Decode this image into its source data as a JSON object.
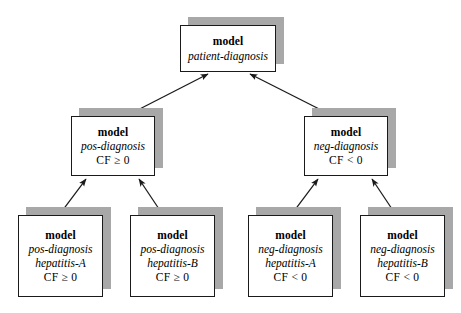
{
  "diagram": {
    "type": "model-hierarchy-tree",
    "title_text": "",
    "edge_direction": "child-to-parent",
    "colors": {
      "box_fill": "#ffffff",
      "box_border": "#1a1a1a",
      "shadow": "#a8a8a8",
      "edge": "#1a1a1a",
      "text": "#000000"
    },
    "nodes": [
      {
        "id": "root",
        "label_model": "model",
        "label_name": "patient-diagnosis",
        "label_cf": "",
        "x": 180,
        "y": 25,
        "w": 96,
        "h": 47
      },
      {
        "id": "pos-diagnosis",
        "label_model": "model",
        "label_name": "pos-diagnosis",
        "label_cf": "CF ≥ 0",
        "x": 71,
        "y": 116,
        "w": 84,
        "h": 60
      },
      {
        "id": "neg-diagnosis",
        "label_model": "model",
        "label_name": "neg-diagnosis",
        "label_cf": "CF < 0",
        "x": 304,
        "y": 116,
        "w": 84,
        "h": 60
      },
      {
        "id": "pos-hep-a",
        "label_model": "model",
        "label_name": "pos-diagnosis",
        "label_name2": "hepatitis-A",
        "label_cf": "CF ≥ 0",
        "x": 18,
        "y": 215,
        "w": 85,
        "h": 82
      },
      {
        "id": "pos-hep-b",
        "label_model": "model",
        "label_name": "pos-diagnosis",
        "label_name2": "hepatitis-B",
        "label_cf": "CF ≥ 0",
        "x": 130,
        "y": 215,
        "w": 85,
        "h": 82
      },
      {
        "id": "neg-hep-a",
        "label_model": "model",
        "label_name": "neg-diagnosis",
        "label_name2": "hepatitis-A",
        "label_cf": "CF < 0",
        "x": 248,
        "y": 215,
        "w": 85,
        "h": 82
      },
      {
        "id": "neg-hep-b",
        "label_model": "model",
        "label_name": "neg-diagnosis",
        "label_name2": "hepatitis-B",
        "label_cf": "CF < 0",
        "x": 360,
        "y": 215,
        "w": 85,
        "h": 82
      }
    ],
    "edges": [
      {
        "from": "pos-diagnosis",
        "to": "root"
      },
      {
        "from": "neg-diagnosis",
        "to": "root"
      },
      {
        "from": "pos-hep-a",
        "to": "pos-diagnosis"
      },
      {
        "from": "pos-hep-b",
        "to": "pos-diagnosis"
      },
      {
        "from": "neg-hep-a",
        "to": "neg-diagnosis"
      },
      {
        "from": "neg-hep-b",
        "to": "neg-diagnosis"
      }
    ]
  }
}
